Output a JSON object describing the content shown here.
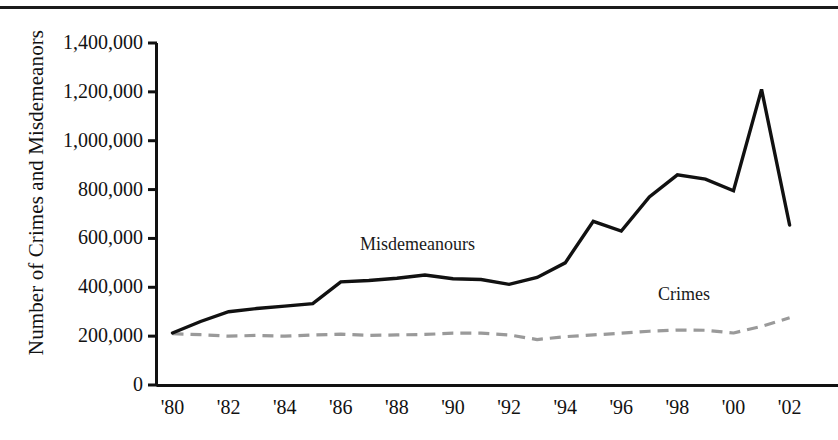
{
  "chart_data": {
    "type": "line",
    "title": "",
    "xlabel": "",
    "ylabel": "Number of Crimes and Misdemeanors",
    "xlim": [
      1980,
      2002
    ],
    "ylim": [
      0,
      1400000
    ],
    "grid": false,
    "legend_position": "inline-annotations",
    "x": [
      1980,
      1981,
      1982,
      1983,
      1984,
      1985,
      1986,
      1987,
      1988,
      1989,
      1990,
      1991,
      1992,
      1993,
      1994,
      1995,
      1996,
      1997,
      1998,
      1999,
      2000,
      2001,
      2002
    ],
    "x_tick_labels": [
      "'80",
      "'82",
      "'84",
      "'86",
      "'88",
      "'90",
      "'92",
      "'94",
      "'96",
      "'98",
      "'00",
      "'02"
    ],
    "x_tick_values": [
      1980,
      1982,
      1984,
      1986,
      1988,
      1990,
      1992,
      1994,
      1996,
      1998,
      2000,
      2002
    ],
    "y_tick_labels": [
      "1,400,000",
      "1,200,000",
      "1,000,000",
      "800,000",
      "600,000",
      "400,000",
      "200,000",
      "0"
    ],
    "y_tick_values": [
      1400000,
      1200000,
      1000000,
      800000,
      600000,
      400000,
      200000,
      0
    ],
    "series": [
      {
        "name": "Misdemeanours",
        "style": "solid",
        "color": "#111111",
        "annotation_label": "Misdemeanours",
        "values": [
          213000,
          260000,
          300000,
          313000,
          323000,
          333000,
          422000,
          428000,
          437000,
          450000,
          435000,
          432000,
          412000,
          440000,
          500000,
          670000,
          630000,
          770000,
          860000,
          843000,
          795000,
          1210000,
          655000
        ]
      },
      {
        "name": "Crimes",
        "style": "dashed",
        "color": "#9a9a9a",
        "annotation_label": "Crimes",
        "values": [
          210000,
          206000,
          200000,
          203000,
          200000,
          205000,
          208000,
          203000,
          205000,
          207000,
          212000,
          212000,
          205000,
          186000,
          198000,
          205000,
          212000,
          220000,
          225000,
          224000,
          213000,
          240000,
          275000
        ]
      }
    ]
  },
  "axis": {
    "y_title": "Number of Crimes and Misdemeanors"
  }
}
